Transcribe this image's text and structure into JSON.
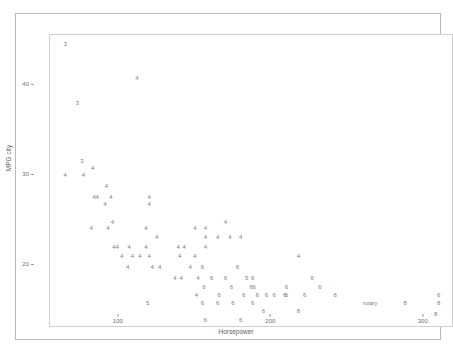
{
  "chart_data": {
    "type": "scatter",
    "title": "",
    "xlabel": "Horsepower",
    "ylabel": "MPG city",
    "xlim": [
      45,
      310
    ],
    "ylim": [
      14.5,
      47
    ],
    "xticks": [
      100,
      200,
      300
    ],
    "xtick_labels": [
      "100",
      "200",
      "300"
    ],
    "yticks": [
      20,
      30,
      40
    ],
    "ytick_labels": [
      "20",
      "30",
      "40"
    ],
    "grid": false,
    "legend": "none",
    "marker_style": "text-label-by-cylinders",
    "point_color": "#7d7d7d",
    "axis_color": "#cfcfcf",
    "frame_color": "#b9b9b9",
    "points": [
      {
        "label": "3",
        "x": 55,
        "y": 46.0
      },
      {
        "label": "4",
        "x": 102,
        "y": 42.2
      },
      {
        "label": "3",
        "x": 63,
        "y": 39.5
      },
      {
        "label": "3",
        "x": 66,
        "y": 33.0
      },
      {
        "label": "4",
        "x": 73,
        "y": 32.3
      },
      {
        "label": "4",
        "x": 55,
        "y": 31.5
      },
      {
        "label": "4",
        "x": 67,
        "y": 31.5
      },
      {
        "label": "4",
        "x": 82,
        "y": 30.2
      },
      {
        "label": "4",
        "x": 74,
        "y": 29.0
      },
      {
        "label": "4",
        "x": 76,
        "y": 29.0
      },
      {
        "label": "4",
        "x": 85,
        "y": 29.0
      },
      {
        "label": "4",
        "x": 110,
        "y": 29.0
      },
      {
        "label": "4",
        "x": 81,
        "y": 28.2
      },
      {
        "label": "4",
        "x": 110,
        "y": 28.2
      },
      {
        "label": "4",
        "x": 86,
        "y": 26.3
      },
      {
        "label": "4",
        "x": 160,
        "y": 26.3
      },
      {
        "label": "4",
        "x": 72,
        "y": 25.6
      },
      {
        "label": "4",
        "x": 83,
        "y": 25.6
      },
      {
        "label": "4",
        "x": 108,
        "y": 25.6
      },
      {
        "label": "4",
        "x": 140,
        "y": 25.6
      },
      {
        "label": "4",
        "x": 147,
        "y": 25.6
      },
      {
        "label": "4",
        "x": 115,
        "y": 24.6
      },
      {
        "label": "4",
        "x": 147,
        "y": 24.6
      },
      {
        "label": "4",
        "x": 155,
        "y": 24.6
      },
      {
        "label": "4",
        "x": 163,
        "y": 24.6
      },
      {
        "label": "4",
        "x": 170,
        "y": 24.6
      },
      {
        "label": "4",
        "x": 87,
        "y": 23.5
      },
      {
        "label": "4",
        "x": 89,
        "y": 23.5
      },
      {
        "label": "4",
        "x": 97,
        "y": 23.5
      },
      {
        "label": "4",
        "x": 108,
        "y": 23.5
      },
      {
        "label": "4",
        "x": 129,
        "y": 23.5
      },
      {
        "label": "4",
        "x": 133,
        "y": 23.5
      },
      {
        "label": "4",
        "x": 147,
        "y": 23.5
      },
      {
        "label": "4",
        "x": 92,
        "y": 22.5
      },
      {
        "label": "4",
        "x": 99,
        "y": 22.5
      },
      {
        "label": "4",
        "x": 104,
        "y": 22.5
      },
      {
        "label": "4",
        "x": 110,
        "y": 22.5
      },
      {
        "label": "4",
        "x": 130,
        "y": 22.5
      },
      {
        "label": "4",
        "x": 140,
        "y": 22.5
      },
      {
        "label": "4",
        "x": 208,
        "y": 22.5
      },
      {
        "label": "4",
        "x": 96,
        "y": 21.3
      },
      {
        "label": "4",
        "x": 112,
        "y": 21.3
      },
      {
        "label": "4",
        "x": 117,
        "y": 21.3
      },
      {
        "label": "4",
        "x": 137,
        "y": 21.3
      },
      {
        "label": "6",
        "x": 145,
        "y": 21.3
      },
      {
        "label": "6",
        "x": 168,
        "y": 21.3
      },
      {
        "label": "4",
        "x": 127,
        "y": 20.0
      },
      {
        "label": "4",
        "x": 131,
        "y": 20.0
      },
      {
        "label": "4",
        "x": 142,
        "y": 20.0
      },
      {
        "label": "6",
        "x": 151,
        "y": 20.0
      },
      {
        "label": "6",
        "x": 160,
        "y": 20.0
      },
      {
        "label": "5",
        "x": 174,
        "y": 20.0
      },
      {
        "label": "6",
        "x": 178,
        "y": 20.0
      },
      {
        "label": "6",
        "x": 217,
        "y": 20.0
      },
      {
        "label": "6",
        "x": 146,
        "y": 19.0
      },
      {
        "label": "6",
        "x": 164,
        "y": 19.0
      },
      {
        "label": "6",
        "x": 177,
        "y": 19.0
      },
      {
        "label": "6",
        "x": 179,
        "y": 19.0
      },
      {
        "label": "6",
        "x": 200,
        "y": 19.0
      },
      {
        "label": "6",
        "x": 222,
        "y": 19.0
      },
      {
        "label": "4",
        "x": 141,
        "y": 18.2
      },
      {
        "label": "6",
        "x": 156,
        "y": 18.2
      },
      {
        "label": "6",
        "x": 172,
        "y": 18.2
      },
      {
        "label": "6",
        "x": 181,
        "y": 18.2
      },
      {
        "label": "6",
        "x": 187,
        "y": 18.2
      },
      {
        "label": "6",
        "x": 192,
        "y": 18.2
      },
      {
        "label": "6",
        "x": 199,
        "y": 18.2
      },
      {
        "label": "6",
        "x": 200,
        "y": 18.2
      },
      {
        "label": "6",
        "x": 212,
        "y": 18.2
      },
      {
        "label": "6",
        "x": 232,
        "y": 18.2
      },
      {
        "label": "6",
        "x": 300,
        "y": 18.2
      },
      {
        "label": "5",
        "x": 109,
        "y": 17.3
      },
      {
        "label": "6",
        "x": 145,
        "y": 17.3
      },
      {
        "label": "6",
        "x": 155,
        "y": 17.3
      },
      {
        "label": "6",
        "x": 165,
        "y": 17.3
      },
      {
        "label": "6",
        "x": 178,
        "y": 17.3
      },
      {
        "label": "rotary",
        "x": 255,
        "y": 17.3
      },
      {
        "label": "8",
        "x": 278,
        "y": 17.3
      },
      {
        "label": "8",
        "x": 300,
        "y": 17.3
      },
      {
        "label": "6",
        "x": 185,
        "y": 16.4
      },
      {
        "label": "8",
        "x": 208,
        "y": 16.4
      },
      {
        "label": "8",
        "x": 298,
        "y": 16.0
      },
      {
        "label": "6",
        "x": 147,
        "y": 15.4
      },
      {
        "label": "6",
        "x": 170,
        "y": 15.4
      }
    ]
  }
}
